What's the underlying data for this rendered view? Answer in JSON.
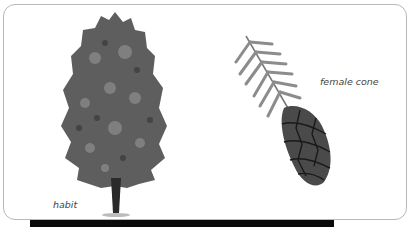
{
  "illustration": {
    "labels": {
      "habit": "habit",
      "female_cone": "female cone"
    },
    "colors": {
      "frame_border": "#b8b8b8",
      "foliage": "#5a5a5a",
      "foliage_light": "#8a8a8a",
      "trunk": "#2a2a2a",
      "cone": "#4a4a4a",
      "needle": "#8c8c8c",
      "bottom_bar": "#0a0a0a"
    }
  }
}
